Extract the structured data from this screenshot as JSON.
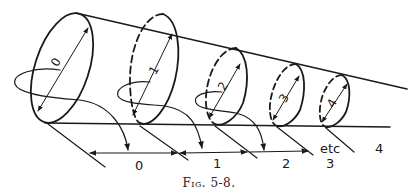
{
  "figure": {
    "caption": "Fig. 5-8.",
    "ink_color": "#1a1a1a",
    "circle_labels": [
      "0",
      "1",
      "2",
      "3",
      "4"
    ],
    "segment_labels": [
      "0",
      "1",
      "2",
      "3",
      "4"
    ],
    "continuation_label": "etc"
  }
}
